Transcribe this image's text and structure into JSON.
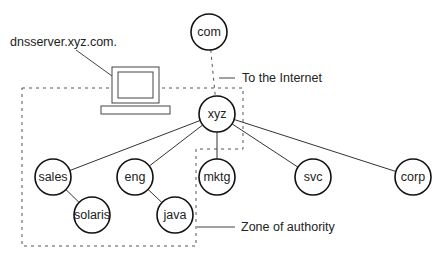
{
  "diagram": {
    "nodes": [
      {
        "id": "com",
        "label": "com"
      },
      {
        "id": "xyz",
        "label": "xyz"
      },
      {
        "id": "sales",
        "label": "sales"
      },
      {
        "id": "eng",
        "label": "eng"
      },
      {
        "id": "mktg",
        "label": "mktg"
      },
      {
        "id": "svc",
        "label": "svc"
      },
      {
        "id": "corp",
        "label": "corp"
      },
      {
        "id": "solaris",
        "label": "solaris"
      },
      {
        "id": "java",
        "label": "java"
      }
    ],
    "edges": [
      {
        "from": "com",
        "to": "xyz",
        "style": "dashed"
      },
      {
        "from": "xyz",
        "to": "sales",
        "style": "solid"
      },
      {
        "from": "xyz",
        "to": "eng",
        "style": "solid"
      },
      {
        "from": "xyz",
        "to": "mktg",
        "style": "solid"
      },
      {
        "from": "xyz",
        "to": "svc",
        "style": "solid"
      },
      {
        "from": "xyz",
        "to": "corp",
        "style": "solid"
      },
      {
        "from": "sales",
        "to": "solaris",
        "style": "solid"
      },
      {
        "from": "eng",
        "to": "java",
        "style": "solid"
      }
    ],
    "annotations": {
      "server": "dnsserver.xyz.com.",
      "internet": "To the Internet",
      "zone": "Zone of authority"
    },
    "icons": {
      "server": "computer-icon"
    }
  }
}
